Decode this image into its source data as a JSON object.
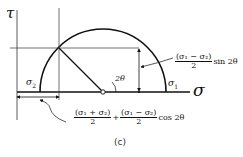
{
  "figure": {
    "caption": "(c)",
    "axes": {
      "vertical_label": "τ",
      "horizontal_label": "σ"
    },
    "points": {
      "sigma2_label": "σ",
      "sigma2_sub": "2",
      "sigma1_label": "σ",
      "sigma1_sub": "1",
      "center_marker": "circle-center"
    },
    "angle_label": "2θ",
    "shear_annotation": {
      "numerator": "(σ₁ − σ₂)",
      "denominator": "2",
      "suffix": "sin 2θ"
    },
    "normal_annotation": {
      "term1_numerator": "(σ₁ + σ₂)",
      "term1_denominator": "2",
      "operator": "+",
      "term2_numerator": "(σ₁ − σ₂)",
      "term2_denominator": "2",
      "suffix": "cos 2θ"
    },
    "colors": {
      "stroke": "#111111",
      "thin_stroke": "#333333",
      "background": "#ffffff"
    }
  }
}
